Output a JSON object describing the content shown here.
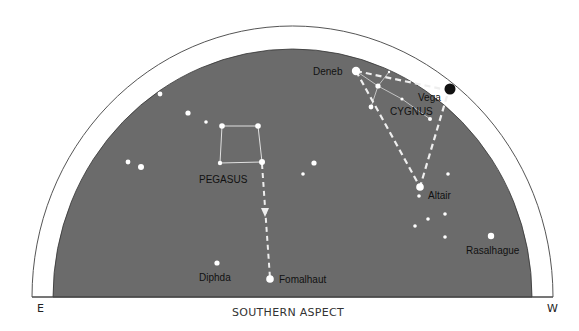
{
  "title": "SOUTHERN ASPECT",
  "colors": {
    "sky": "#6b6b6b",
    "ring": "#ffffff",
    "outline": "#555555",
    "star": "#ffffff",
    "line": "#e6e6e6",
    "vega": "#111111"
  },
  "directions": {
    "east": "E",
    "west": "W"
  },
  "constellations": [
    {
      "name": "PEGASUS",
      "id": "pegasus"
    },
    {
      "name": "CYGNUS",
      "id": "cygnus"
    }
  ],
  "named_stars": [
    {
      "name": "Deneb",
      "id": "deneb",
      "magnitude_class": "bright"
    },
    {
      "name": "Vega",
      "id": "vega",
      "magnitude_class": "bright",
      "marker": "black-disc-on-horizon-ring"
    },
    {
      "name": "Altair",
      "id": "altair",
      "magnitude_class": "bright"
    },
    {
      "name": "Fomalhaut",
      "id": "fomalhaut",
      "magnitude_class": "bright"
    },
    {
      "name": "Diphda",
      "id": "diphda",
      "magnitude_class": "medium"
    },
    {
      "name": "Rasalhague",
      "id": "rasalhague",
      "magnitude_class": "bright"
    }
  ],
  "asterisms": [
    {
      "name": "Summer Triangle",
      "members": [
        "Deneb",
        "Vega",
        "Altair"
      ],
      "style": "dashed"
    },
    {
      "name": "Pegasus to Fomalhaut pointer",
      "members": [
        "Pegasus square (SE corner)",
        "Fomalhaut"
      ],
      "style": "dashed-arrow"
    }
  ]
}
